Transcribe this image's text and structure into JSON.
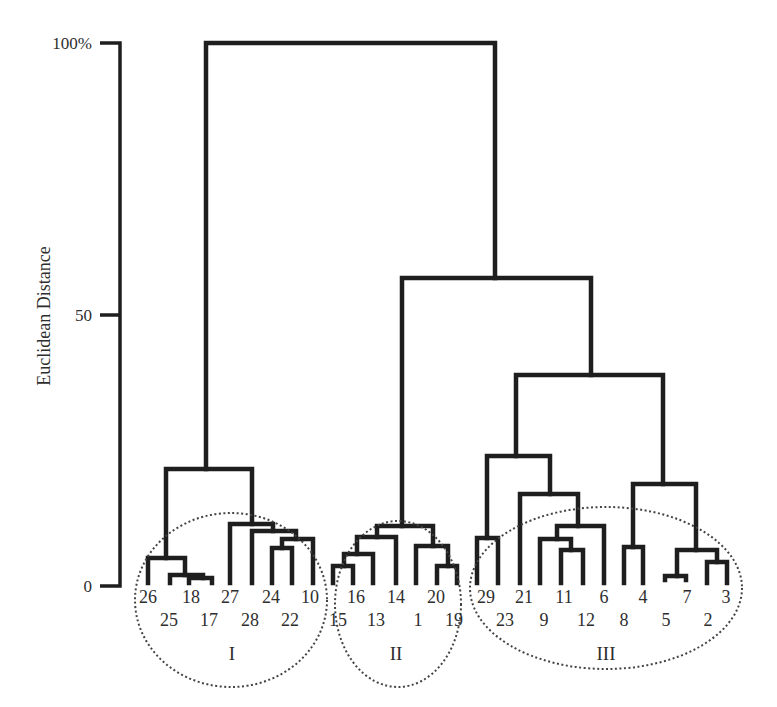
{
  "chart_data": {
    "type": "dendrogram",
    "title": "",
    "xlabel": "",
    "ylabel": "Euclidean Distance",
    "y_ticks": [
      {
        "value": 0,
        "label": "0"
      },
      {
        "value": 50,
        "label": "50"
      },
      {
        "value": 100,
        "label": "100%"
      }
    ],
    "ylim": [
      0,
      100
    ],
    "grid": false,
    "leaf_order": [
      26,
      25,
      18,
      17,
      27,
      28,
      24,
      22,
      10,
      15,
      16,
      13,
      14,
      1,
      20,
      19,
      29,
      23,
      21,
      9,
      11,
      12,
      6,
      8,
      4,
      5,
      7,
      2,
      3
    ],
    "leaf_label_rows": {
      "upper": [
        26,
        18,
        27,
        24,
        10,
        16,
        14,
        20,
        29,
        21,
        11,
        6,
        4,
        7,
        3
      ],
      "lower": [
        25,
        17,
        28,
        22,
        15,
        13,
        1,
        19,
        23,
        9,
        12,
        8,
        5,
        2
      ]
    },
    "clusters": [
      {
        "name": "I",
        "members": [
          26,
          25,
          18,
          17,
          27,
          28,
          24,
          22,
          10
        ],
        "merge_height": 22
      },
      {
        "name": "II",
        "members": [
          15,
          16,
          13,
          14,
          1,
          20,
          19
        ],
        "merge_height": 11
      },
      {
        "name": "III",
        "members": [
          29,
          23,
          21,
          9,
          11,
          12,
          6,
          8,
          4,
          5,
          7,
          2,
          3
        ],
        "merge_height": 39
      }
    ],
    "merges": [
      {
        "between": [
          "I",
          "II+III"
        ],
        "height": 100
      },
      {
        "between": [
          "II",
          "III"
        ],
        "height": 57
      },
      {
        "between": [
          "29,23",
          "rest of III"
        ],
        "height": 24
      },
      {
        "between": [
          "21",
          "9,11,12,6"
        ],
        "height": 17
      },
      {
        "between": [
          "8,4",
          "5,7,2,3"
        ],
        "height": 14
      },
      {
        "between": [
          "26/25 group",
          "18/17 group"
        ],
        "height": 5
      },
      {
        "between": [
          "27",
          "28,24,22,10"
        ],
        "height": 12
      }
    ],
    "annotations": [
      "Dotted ellipses enclose clusters I, II, III"
    ]
  },
  "axis": {
    "ylabel": "Euclidean Distance",
    "ticks": [
      "100%",
      "50",
      "0"
    ]
  },
  "leaves_upper": [
    {
      "label": "26",
      "x": 148
    },
    {
      "label": "18",
      "x": 191
    },
    {
      "label": "27",
      "x": 230
    },
    {
      "label": "24",
      "x": 271
    },
    {
      "label": "10",
      "x": 310
    },
    {
      "label": "16",
      "x": 356
    },
    {
      "label": "14",
      "x": 396
    },
    {
      "label": "20",
      "x": 436
    },
    {
      "label": "29",
      "x": 486
    },
    {
      "label": "21",
      "x": 524
    },
    {
      "label": "11",
      "x": 564
    },
    {
      "label": "6",
      "x": 604
    },
    {
      "label": "4",
      "x": 643
    },
    {
      "label": "7",
      "x": 687
    },
    {
      "label": "3",
      "x": 726
    }
  ],
  "leaves_lower": [
    {
      "label": "25",
      "x": 169
    },
    {
      "label": "17",
      "x": 209
    },
    {
      "label": "28",
      "x": 250
    },
    {
      "label": "22",
      "x": 290
    },
    {
      "label": "15",
      "x": 338
    },
    {
      "label": "13",
      "x": 376
    },
    {
      "label": "1",
      "x": 418
    },
    {
      "label": "19",
      "x": 454
    },
    {
      "label": "23",
      "x": 505
    },
    {
      "label": "9",
      "x": 544
    },
    {
      "label": "12",
      "x": 586
    },
    {
      "label": "8",
      "x": 624
    },
    {
      "label": "5",
      "x": 666
    },
    {
      "label": "2",
      "x": 708
    }
  ],
  "cluster_labels": [
    {
      "label": "I",
      "x": 232
    },
    {
      "label": "II",
      "x": 396
    },
    {
      "label": "III",
      "x": 606
    }
  ]
}
